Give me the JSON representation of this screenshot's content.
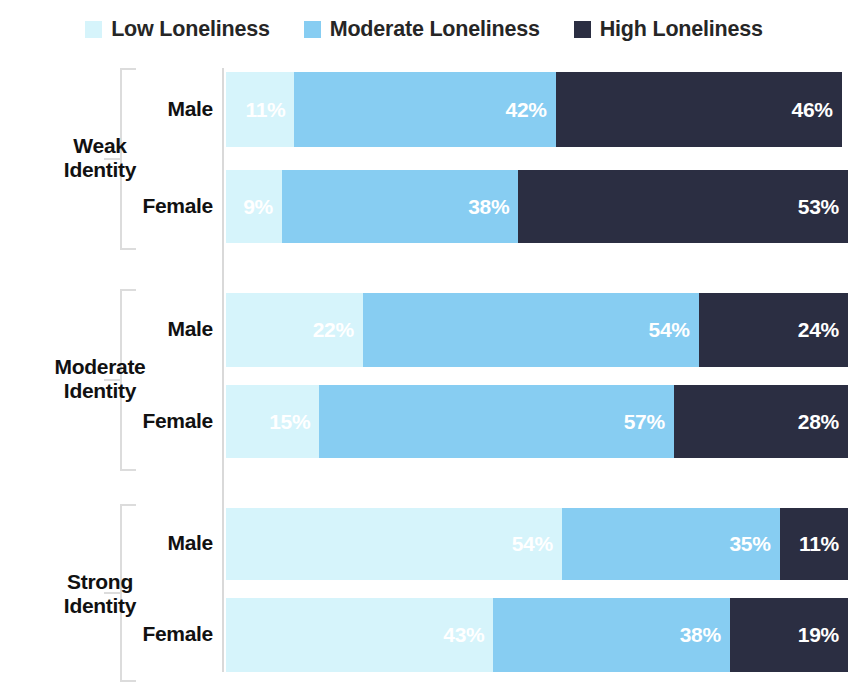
{
  "legend": {
    "items": [
      {
        "label": "Low Loneliness",
        "color": "#d6f4fb",
        "key": "low"
      },
      {
        "label": "Moderate Loneliness",
        "color": "#87cdf2",
        "key": "moderate"
      },
      {
        "label": "High Loneliness",
        "color": "#2b2e42",
        "key": "high"
      }
    ]
  },
  "groups": [
    {
      "label": "Weak\nIdentity",
      "label_line1": "Weak",
      "label_line2": "Identity",
      "rows": [
        {
          "series": "Male",
          "values": [
            11,
            42,
            46
          ],
          "labels": [
            "11%",
            "42%",
            "46%"
          ]
        },
        {
          "series": "Female",
          "values": [
            9,
            38,
            53
          ],
          "labels": [
            "9%",
            "38%",
            "53%"
          ]
        }
      ]
    },
    {
      "label": "Moderate\nIdentity",
      "label_line1": "Moderate",
      "label_line2": "Identity",
      "rows": [
        {
          "series": "Male",
          "values": [
            22,
            54,
            24
          ],
          "labels": [
            "22%",
            "54%",
            "24%"
          ]
        },
        {
          "series": "Female",
          "values": [
            15,
            57,
            28
          ],
          "labels": [
            "15%",
            "57%",
            "28%"
          ]
        }
      ]
    },
    {
      "label": "Strong\nIdentity",
      "label_line1": "Strong",
      "label_line2": "Identity",
      "rows": [
        {
          "series": "Male",
          "values": [
            54,
            35,
            11
          ],
          "labels": [
            "54%",
            "35%",
            "11%"
          ]
        },
        {
          "series": "Female",
          "values": [
            43,
            38,
            19
          ],
          "labels": [
            "43%",
            "38%",
            "19%"
          ]
        }
      ]
    }
  ],
  "chart_data": {
    "type": "bar",
    "orientation": "horizontal",
    "stacked": true,
    "normalized_percent": true,
    "title": "",
    "subtitle": "",
    "xlabel": "",
    "ylabel": "",
    "xlim": [
      0,
      100
    ],
    "grid": false,
    "legend_position": "top-center",
    "categories": [
      "Weak Identity - Male",
      "Weak Identity - Female",
      "Moderate Identity - Male",
      "Moderate Identity - Female",
      "Strong Identity - Male",
      "Strong Identity - Female"
    ],
    "group_categories": [
      "Weak Identity",
      "Moderate Identity",
      "Strong Identity"
    ],
    "subgroup_categories": [
      "Male",
      "Female"
    ],
    "series": [
      {
        "name": "Low Loneliness",
        "color": "#d6f4fb",
        "values": [
          11,
          9,
          22,
          15,
          54,
          43
        ]
      },
      {
        "name": "Moderate Loneliness",
        "color": "#87cdf2",
        "values": [
          42,
          38,
          54,
          57,
          35,
          38
        ]
      },
      {
        "name": "High Loneliness",
        "color": "#2b2e42",
        "values": [
          46,
          53,
          24,
          28,
          11,
          19
        ]
      }
    ],
    "data_labels": [
      [
        "11%",
        "42%",
        "46%"
      ],
      [
        "9%",
        "38%",
        "53%"
      ],
      [
        "22%",
        "54%",
        "24%"
      ],
      [
        "15%",
        "57%",
        "28%"
      ],
      [
        "54%",
        "35%",
        "11%"
      ],
      [
        "43%",
        "38%",
        "19%"
      ]
    ],
    "tick_labels": [],
    "annotations": []
  },
  "layout": {
    "bar_left_px": 226,
    "bar_width_px": 622,
    "axis_x_px": 222,
    "rows": [
      {
        "top": 14,
        "height": 75
      },
      {
        "top": 112,
        "height": 73
      },
      {
        "top": 235,
        "height": 74
      },
      {
        "top": 327,
        "height": 73
      },
      {
        "top": 450,
        "height": 72
      },
      {
        "top": 540,
        "height": 74
      }
    ],
    "brackets": [
      {
        "top": 10,
        "height": 182
      },
      {
        "top": 231,
        "height": 182
      },
      {
        "top": 446,
        "height": 178
      }
    ],
    "group_labels": [
      {
        "top": 76
      },
      {
        "top": 297
      },
      {
        "top": 512
      }
    ],
    "bracket_stems": [
      {
        "top": 100
      },
      {
        "top": 321
      },
      {
        "top": 534
      }
    ]
  }
}
